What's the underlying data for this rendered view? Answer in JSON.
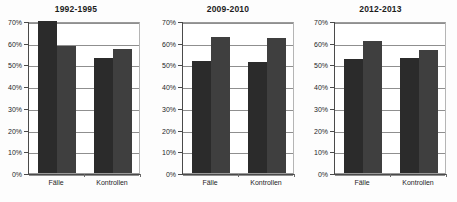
{
  "chart_data": [
    {
      "type": "bar",
      "title": "1992-1995",
      "categories": [
        "Fälle",
        "Kontrollen"
      ],
      "series": [
        {
          "name": "series-1",
          "values": [
            70,
            53
          ],
          "color": "#2b2b2b"
        },
        {
          "name": "series-2",
          "values": [
            58.5,
            57
          ],
          "color": "#3f3f3f"
        }
      ],
      "xlabel": "",
      "ylabel": "",
      "ylim": [
        0,
        70
      ],
      "yticks": [
        "0%",
        "10%",
        "20%",
        "30%",
        "40%",
        "50%",
        "60%",
        "70%"
      ],
      "ytick_values": [
        0,
        10,
        20,
        30,
        40,
        50,
        60,
        70
      ],
      "grid": true,
      "legend": "none"
    },
    {
      "type": "bar",
      "title": "2009-2010",
      "categories": [
        "Fälle",
        "Kontrollen"
      ],
      "series": [
        {
          "name": "series-1",
          "values": [
            51.5,
            51
          ],
          "color": "#2b2b2b"
        },
        {
          "name": "series-2",
          "values": [
            62.5,
            62
          ],
          "color": "#3f3f3f"
        }
      ],
      "xlabel": "",
      "ylabel": "",
      "ylim": [
        0,
        70
      ],
      "yticks": [
        "0%",
        "10%",
        "20%",
        "30%",
        "40%",
        "50%",
        "60%",
        "70%"
      ],
      "ytick_values": [
        0,
        10,
        20,
        30,
        40,
        50,
        60,
        70
      ],
      "grid": true,
      "legend": "none"
    },
    {
      "type": "bar",
      "title": "2012-2013",
      "categories": [
        "Fälle",
        "Kontrollen"
      ],
      "series": [
        {
          "name": "series-1",
          "values": [
            52.5,
            53
          ],
          "color": "#2b2b2b"
        },
        {
          "name": "series-2",
          "values": [
            61,
            56.5
          ],
          "color": "#3f3f3f"
        }
      ],
      "xlabel": "",
      "ylabel": "",
      "ylim": [
        0,
        70
      ],
      "yticks": [
        "0%",
        "10%",
        "20%",
        "30%",
        "40%",
        "50%",
        "60%",
        "70%"
      ],
      "ytick_values": [
        0,
        10,
        20,
        30,
        40,
        50,
        60,
        70
      ],
      "grid": true,
      "legend": "none"
    }
  ],
  "panels": [
    {
      "title": "1992-1995"
    },
    {
      "title": "2009-2010"
    },
    {
      "title": "2012-2013"
    }
  ],
  "colors": {
    "series_1": "#2b2b2b",
    "series_2": "#3f3f3f",
    "grid": "#8f8f8f",
    "axis": "#4a4a4a",
    "text": "#1e1e1e",
    "background": "#ffffff"
  }
}
